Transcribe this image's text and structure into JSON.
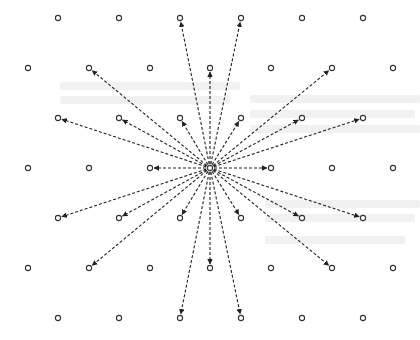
{
  "diagram": {
    "type": "lattice-radial-arrows",
    "colors": {
      "background": "#ffffff",
      "point_stroke": "#333333",
      "arrow": "#222222"
    },
    "center": {
      "x": 210,
      "y": 168
    },
    "point_radius": 2.6,
    "rows": [
      {
        "y": 18,
        "xs": [
          58,
          119,
          180,
          241,
          302,
          363
        ]
      },
      {
        "y": 68,
        "xs": [
          28,
          89,
          150,
          210,
          271,
          332,
          393
        ]
      },
      {
        "y": 118,
        "xs": [
          58,
          119,
          180,
          241,
          302,
          363
        ]
      },
      {
        "y": 168,
        "xs": [
          28,
          89,
          150,
          210,
          271,
          332,
          393
        ]
      },
      {
        "y": 218,
        "xs": [
          58,
          119,
          180,
          241,
          302,
          363
        ]
      },
      {
        "y": 268,
        "xs": [
          28,
          89,
          150,
          210,
          271,
          332,
          393
        ]
      },
      {
        "y": 318,
        "xs": [
          58,
          119,
          180,
          241,
          302,
          363
        ]
      }
    ],
    "arrow_targets": [
      {
        "x": 180,
        "y": 18
      },
      {
        "x": 241,
        "y": 18
      },
      {
        "x": 89,
        "y": 68
      },
      {
        "x": 210,
        "y": 68
      },
      {
        "x": 332,
        "y": 68
      },
      {
        "x": 58,
        "y": 118
      },
      {
        "x": 119,
        "y": 118
      },
      {
        "x": 180,
        "y": 118
      },
      {
        "x": 241,
        "y": 118
      },
      {
        "x": 302,
        "y": 118
      },
      {
        "x": 363,
        "y": 118
      },
      {
        "x": 150,
        "y": 168
      },
      {
        "x": 271,
        "y": 168
      },
      {
        "x": 58,
        "y": 218
      },
      {
        "x": 119,
        "y": 218
      },
      {
        "x": 180,
        "y": 218
      },
      {
        "x": 241,
        "y": 218
      },
      {
        "x": 302,
        "y": 218
      },
      {
        "x": 363,
        "y": 218
      },
      {
        "x": 89,
        "y": 268
      },
      {
        "x": 210,
        "y": 268
      },
      {
        "x": 332,
        "y": 268
      },
      {
        "x": 180,
        "y": 318
      },
      {
        "x": 241,
        "y": 318
      }
    ],
    "arrow_count": 24,
    "point_count": 45
  }
}
